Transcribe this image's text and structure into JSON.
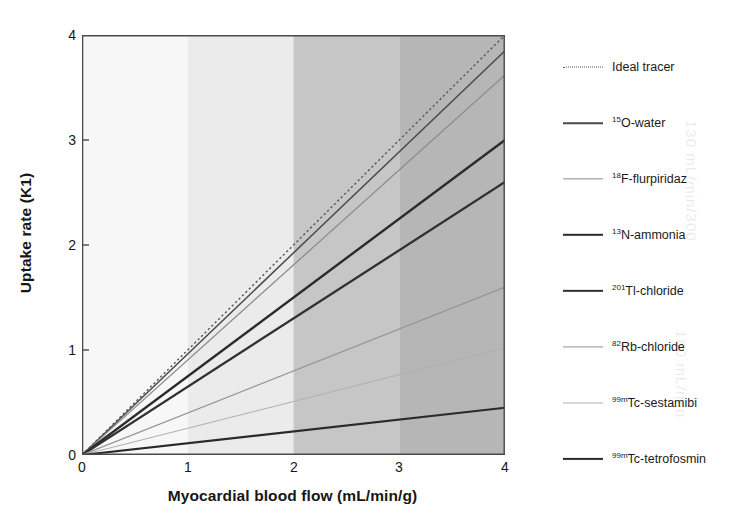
{
  "chart_data": {
    "type": "line",
    "title": "",
    "xlabel": "Myocardial blood flow (mL/min/g)",
    "ylabel": "Uptake rate (K1)",
    "xlim": [
      0,
      4
    ],
    "ylim": [
      0,
      4
    ],
    "xticks": [
      "0",
      "1",
      "2",
      "3",
      "4"
    ],
    "yticks": [
      "0",
      "1",
      "2",
      "3",
      "4"
    ],
    "grid": false,
    "legend_position": "right",
    "background_bands": [
      {
        "from": 0,
        "to": 1,
        "color": "#f7f7f7"
      },
      {
        "from": 1,
        "to": 2,
        "color": "#ebebeb"
      },
      {
        "from": 2,
        "to": 3,
        "color": "#c6c6c6"
      },
      {
        "from": 3,
        "to": 4,
        "color": "#b6b6b6"
      }
    ],
    "x": [
      0,
      4
    ],
    "series": [
      {
        "name": "Ideal tracer",
        "label_isotope": "",
        "label_rest": "Ideal tracer",
        "values": [
          0,
          4.0
        ],
        "slope": 1.0,
        "style": "dotted",
        "color": "#555555",
        "width": 1.4
      },
      {
        "name": "15O-water",
        "label_isotope": "15",
        "label_rest": "O-water",
        "values": [
          0,
          3.85
        ],
        "slope": 0.9625,
        "style": "solid",
        "color": "#4a4a4a",
        "width": 1.5
      },
      {
        "name": "18F-flurpiridaz",
        "label_isotope": "18",
        "label_rest": "F-flurpiridaz",
        "values": [
          0,
          3.62
        ],
        "slope": 0.905,
        "style": "solid",
        "color": "#8c8c8c",
        "width": 1.3
      },
      {
        "name": "13N-ammonia",
        "label_isotope": "13",
        "label_rest": "N-ammonia",
        "values": [
          0,
          3.0
        ],
        "slope": 0.75,
        "style": "solid",
        "color": "#2b2b2b",
        "width": 2.4
      },
      {
        "name": "201Tl-chloride",
        "label_isotope": "201",
        "label_rest": "Tl-chloride",
        "values": [
          0,
          2.6
        ],
        "slope": 0.65,
        "style": "solid",
        "color": "#303030",
        "width": 2.3
      },
      {
        "name": "82Rb-chloride",
        "label_isotope": "82",
        "label_rest": "Rb-chloride",
        "values": [
          0,
          1.6
        ],
        "slope": 0.4,
        "style": "solid",
        "color": "#949494",
        "width": 1.2
      },
      {
        "name": "99mTc-sestamibi",
        "label_isotope": "99m",
        "label_rest": "Tc-sestamibi",
        "values": [
          0,
          1.02
        ],
        "slope": 0.255,
        "style": "solid",
        "color": "#b0b0b0",
        "width": 1.1
      },
      {
        "name": "99mTc-tetrofosmin",
        "label_isotope": "99m",
        "label_rest": "Tc-tetrofosmin",
        "values": [
          0,
          0.45
        ],
        "slope": 0.1125,
        "style": "solid",
        "color": "#2a2a2a",
        "width": 2.2
      }
    ]
  },
  "axes": {
    "x_title": "Myocardial blood flow (mL/min/g)",
    "y_title": "Uptake rate (K1)",
    "x_tick_0": "0",
    "x_tick_1": "1",
    "x_tick_2": "2",
    "x_tick_3": "3",
    "x_tick_4": "4",
    "y_tick_0": "0",
    "y_tick_1": "1",
    "y_tick_2": "2",
    "y_tick_3": "3",
    "y_tick_4": "4"
  },
  "legend": {
    "items": [
      {
        "isotope": "",
        "text": "Ideal tracer"
      },
      {
        "isotope": "15",
        "text": "O-water"
      },
      {
        "isotope": "18",
        "text": "F-flurpiridaz"
      },
      {
        "isotope": "13",
        "text": "N-ammonia"
      },
      {
        "isotope": "201",
        "text": "Tl-chloride"
      },
      {
        "isotope": "82",
        "text": "Rb-chloride"
      },
      {
        "isotope": "99m",
        "text": "Tc-sestamibi"
      },
      {
        "isotope": "99m",
        "text": "Tc-tetrofosmin"
      }
    ]
  }
}
